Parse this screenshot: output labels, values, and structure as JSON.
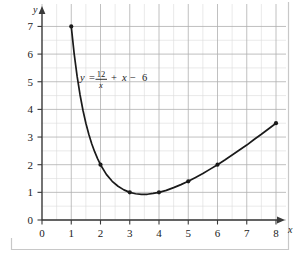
{
  "chart_data": {
    "type": "line",
    "title": "",
    "subtitle": "",
    "xlabel": "x",
    "ylabel": "y",
    "xlim": [
      0,
      8
    ],
    "ylim": [
      0,
      7
    ],
    "grid": true,
    "grid_major_step": 1,
    "grid_minor_step": 0.5,
    "legend": "none",
    "equation_label": "y = 12/x + x - 6",
    "equation_parts": {
      "lhs": "y",
      "equals": "=",
      "numerator": "12",
      "denominator": "x",
      "plus": "+",
      "term_x": "x",
      "minus": "−",
      "constant": "6"
    },
    "x_ticks": [
      "0",
      "1",
      "2",
      "3",
      "4",
      "5",
      "6",
      "7",
      "8"
    ],
    "x_tick_values": [
      0,
      1,
      2,
      3,
      4,
      5,
      6,
      7,
      8
    ],
    "y_ticks": [
      "0",
      "1",
      "2",
      "3",
      "4",
      "5",
      "6",
      "7"
    ],
    "y_tick_values": [
      0,
      1,
      2,
      3,
      4,
      5,
      6,
      7
    ],
    "series": [
      {
        "name": "y = 12/x + x - 6",
        "marker": "dot",
        "color": "#1a1a1a",
        "x": [
          1,
          2,
          3,
          4,
          5,
          6,
          8
        ],
        "values": [
          7,
          2,
          1,
          1,
          1.4,
          2,
          3.5
        ],
        "points": [
          {
            "x": 1,
            "y": 7
          },
          {
            "x": 2,
            "y": 2
          },
          {
            "x": 3,
            "y": 1
          },
          {
            "x": 4,
            "y": 1
          },
          {
            "x": 5,
            "y": 1.4
          },
          {
            "x": 6,
            "y": 2
          },
          {
            "x": 8,
            "y": 3.5
          }
        ]
      }
    ],
    "curve_samples": {
      "x": [
        1,
        1.1,
        1.2,
        1.3,
        1.4,
        1.5,
        1.6,
        1.7,
        1.8,
        1.9,
        2,
        2.2,
        2.4,
        2.6,
        2.8,
        3,
        3.2,
        3.4,
        3.6,
        3.8,
        4,
        4.25,
        4.5,
        4.75,
        5,
        5.25,
        5.5,
        5.75,
        6,
        6.25,
        6.5,
        6.75,
        7,
        7.25,
        7.5,
        7.75,
        8
      ],
      "y": [
        7,
        6.01,
        5.2,
        4.53,
        3.97,
        3.5,
        3.1,
        2.76,
        2.47,
        2.22,
        2,
        1.65,
        1.4,
        1.22,
        1.09,
        1,
        0.95,
        0.93,
        0.93,
        0.96,
        1,
        1.07,
        1.17,
        1.28,
        1.4,
        1.54,
        1.68,
        1.84,
        2,
        2.17,
        2.35,
        2.53,
        2.71,
        2.91,
        3.1,
        3.3,
        3.5
      ]
    },
    "axis_arrows": {
      "x": true,
      "y": true
    },
    "colors": {
      "curve": "#1a1a1a",
      "axis": "#3a3a3a",
      "grid_major": "#b0b0b0",
      "grid_minor": "#dcdcdc",
      "border": "#c8c8c8",
      "background": "#ffffff",
      "text": "#1a1a1a"
    }
  }
}
